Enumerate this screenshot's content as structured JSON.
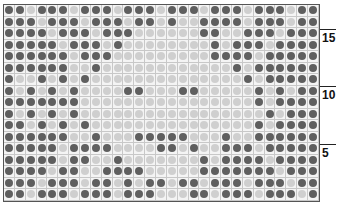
{
  "chart": {
    "title": "",
    "columns": 29,
    "rows": 17,
    "colors": {
      "dark": "#5f5f5f",
      "light": "#cfcfcf",
      "grid_line": "#c8c8c8",
      "border": "#555555"
    },
    "row_markers": [
      {
        "label": "15",
        "row": 15
      },
      {
        "label": "10",
        "row": 10
      },
      {
        "label": "5",
        "row": 5
      }
    ],
    "pattern_top_to_bottom": [
      "DDLDDDLDDDLDDDLDDDLDDDLDDDLDD",
      "DDDLDDDLDDDLDDLDLLDDDDLDDDLDD",
      "DDDDLDDDLDDDLLLLLLDDLLDDDLDDD",
      "DDDDDLDDDLDLLLLLLLLDLDDDLDDDD",
      "DDDDDDLDDDLLLLLLLLLDDDDLDDDDD",
      "DDDDDDLLDLLLLLLLLLLLLDLDDDDDD",
      "DLLDLDLDLLLLLLLLLLLLLLDLDDDDD",
      "DLDLDLDLLLLDDLLLDDLLLLLDLDLDD",
      "DDDDDDDLLLLLLLLLLLLLLLLDLDDDD",
      "DLDLDLDLLLLLLLLLLLLLLLLLDLDDD",
      "DDLDLDLDLLLLLLLLLLLLLLLDLDDDD",
      "DDDDDDLLDLLLDDDDDLLLDLLDDDDDD",
      "DDDDDLDDDDLLLLDDLDLLDDDLDDDDD",
      "DDDDDLDDLLDLLLLLLLDLDDDDLDDDD",
      "DDDDLDDLLDDDDLLLLLDDDDDDDLDDD",
      "DDDLDDDLDDLDLDDLDDLDDDLDDDLDD",
      "DDLDDDLDDDLDDDLLLDDLDDDLDDDLD"
    ]
  }
}
